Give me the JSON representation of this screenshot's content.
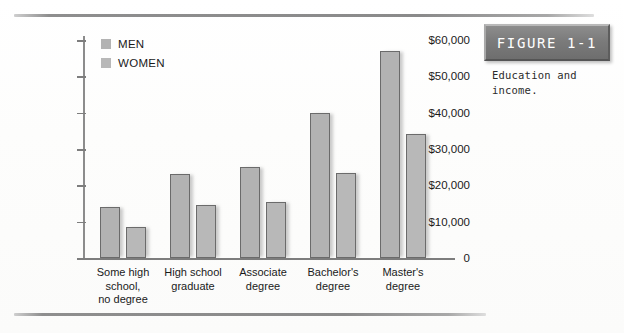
{
  "figure": {
    "plaque_label": "FIGURE 1-1",
    "caption": "Education and income."
  },
  "chart_data": {
    "type": "bar",
    "title": "",
    "subtitle": "",
    "xlabel": "",
    "ylabel": "",
    "categories": [
      "Some high school, no degree",
      "High school graduate",
      "Associate degree",
      "Bachelor's degree",
      "Master's degree"
    ],
    "category_lines": [
      [
        "Some high",
        "school,",
        "no degree"
      ],
      [
        "High school",
        "graduate"
      ],
      [
        "Associate",
        "degree"
      ],
      [
        "Bachelor's",
        "degree"
      ],
      [
        "Master's",
        "degree"
      ]
    ],
    "series": [
      {
        "name": "MEN",
        "color": "#b3b3b3",
        "values": [
          14000,
          23000,
          25000,
          40000,
          57000
        ]
      },
      {
        "name": "WOMEN",
        "color": "#b8b8b8",
        "values": [
          8500,
          14500,
          15500,
          23500,
          34000
        ]
      }
    ],
    "ylim": [
      0,
      60000
    ],
    "ytick_values": [
      0,
      10000,
      20000,
      30000,
      40000,
      50000,
      60000
    ],
    "ytick_labels": [
      "0",
      "$10,000",
      "$20,000",
      "$30,000",
      "$40,000",
      "$50,000",
      "$60,000"
    ],
    "grid": false,
    "legend_position": "top-left",
    "legend": [
      "MEN",
      "WOMEN"
    ]
  }
}
